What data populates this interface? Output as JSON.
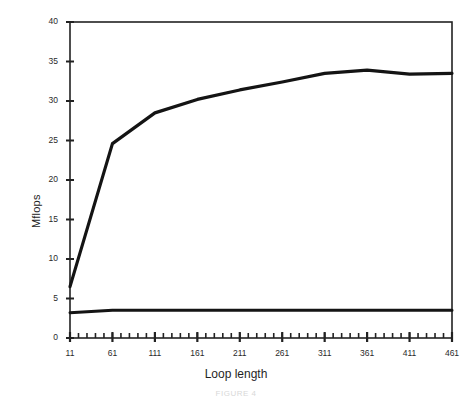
{
  "figure": {
    "caption": "FIGURE 4",
    "background_color": "#ffffff",
    "line_color": "#141414",
    "axis_color": "#222222"
  },
  "chart_data": {
    "type": "line",
    "title": "",
    "xlabel": "Loop length",
    "ylabel": "Mflops",
    "xlim": [
      11,
      461
    ],
    "ylim": [
      0,
      40
    ],
    "grid": false,
    "legend": "none",
    "x_tick_labels": [
      "11",
      "61",
      "111",
      "161",
      "211",
      "261",
      "311",
      "361",
      "411",
      "461"
    ],
    "x_tick_values": [
      11,
      61,
      111,
      161,
      211,
      261,
      311,
      361,
      411,
      461
    ],
    "x_minor_tick_step": 10,
    "y_tick_labels": [
      "0",
      "5",
      "10",
      "15",
      "20",
      "25",
      "30",
      "35",
      "40"
    ],
    "y_tick_values": [
      0,
      5,
      10,
      15,
      20,
      25,
      30,
      35,
      40
    ],
    "x": [
      11,
      61,
      111,
      161,
      211,
      261,
      311,
      361,
      411,
      461
    ],
    "series": [
      {
        "name": "upper-curve",
        "values": [
          6.5,
          24.6,
          28.5,
          30.2,
          31.4,
          32.4,
          33.5,
          33.9,
          33.4,
          33.5
        ],
        "color": "#141414",
        "width": 3.2
      },
      {
        "name": "lower-curve",
        "values": [
          3.2,
          3.5,
          3.5,
          3.5,
          3.5,
          3.5,
          3.5,
          3.5,
          3.5,
          3.5
        ],
        "color": "#141414",
        "width": 3.0
      }
    ]
  },
  "axes": {
    "plot_left_px": 70,
    "plot_right_px": 452,
    "plot_top_px": 22,
    "plot_bottom_px": 338
  }
}
